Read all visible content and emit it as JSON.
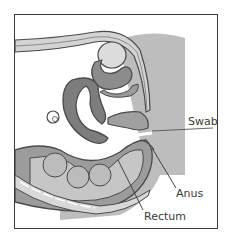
{
  "diagram": {
    "type": "anatomical-cross-section",
    "labels": {
      "swab": "Swab",
      "anus": "Anus",
      "rectum": "Rectum"
    },
    "colors": {
      "outline": "#4a4a4a",
      "dark_tissue": "#7d7d7d",
      "mid_tissue": "#a6a6a6",
      "light_tissue": "#c8c8c8",
      "background_shade": "#bdbdbd",
      "frame_border": "#3a3a3a"
    }
  }
}
